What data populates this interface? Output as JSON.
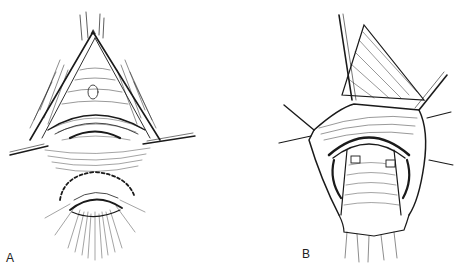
{
  "figure": {
    "panels": [
      {
        "id": "A",
        "label": "A",
        "description": "Line drawing of surgical field: triangular incision with retracted skin edges held by two lateral sutures, mucosal fold in center, lower circular opening outlined by dashed incision line with radiating hatching"
      },
      {
        "id": "B",
        "label": "B",
        "description": "Line drawing of subsequent surgical step: wound edges retracted by multiple stay sutures, mobilized tubular structure in center with two small white rectangular markers, lower end with cut edges"
      }
    ],
    "style": {
      "ink_color": "#1a1a1a",
      "background": "#ffffff"
    }
  }
}
